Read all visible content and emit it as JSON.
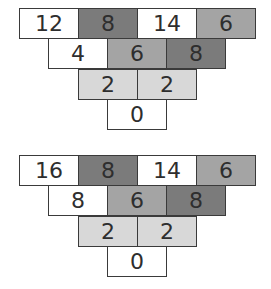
{
  "colors": {
    "white": "#ffffff",
    "light": "#d8d8d8",
    "medium": "#a4a4a4",
    "dark": "#7b7b7b",
    "border": "#3a3a3a",
    "text": "#2e2e2e"
  },
  "pyramids": [
    {
      "rows": [
        [
          {
            "value": "12",
            "shade": "white"
          },
          {
            "value": "8",
            "shade": "dark"
          },
          {
            "value": "14",
            "shade": "white"
          },
          {
            "value": "6",
            "shade": "medium"
          }
        ],
        [
          {
            "value": "4",
            "shade": "white"
          },
          {
            "value": "6",
            "shade": "medium"
          },
          {
            "value": "8",
            "shade": "dark"
          }
        ],
        [
          {
            "value": "2",
            "shade": "light"
          },
          {
            "value": "2",
            "shade": "light"
          }
        ],
        [
          {
            "value": "0",
            "shade": "white"
          }
        ]
      ]
    },
    {
      "rows": [
        [
          {
            "value": "16",
            "shade": "white"
          },
          {
            "value": "8",
            "shade": "dark"
          },
          {
            "value": "14",
            "shade": "white"
          },
          {
            "value": "6",
            "shade": "medium"
          }
        ],
        [
          {
            "value": "8",
            "shade": "white"
          },
          {
            "value": "6",
            "shade": "medium"
          },
          {
            "value": "8",
            "shade": "dark"
          }
        ],
        [
          {
            "value": "2",
            "shade": "light"
          },
          {
            "value": "2",
            "shade": "light"
          }
        ],
        [
          {
            "value": "0",
            "shade": "white"
          }
        ]
      ]
    }
  ]
}
